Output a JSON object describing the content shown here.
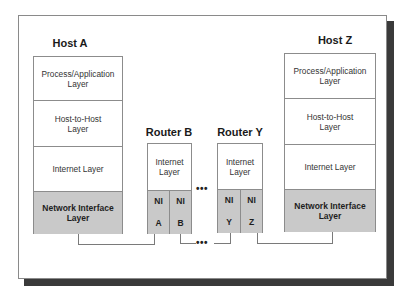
{
  "diagram": {
    "host_a": {
      "title": "Host A",
      "layers": [
        "Process/Application Layer",
        "Host-to-Host Layer",
        "Internet Layer",
        "Network Interface Layer"
      ]
    },
    "router_b": {
      "title": "Router B",
      "internet_layer": "Internet Layer",
      "ni_left": {
        "top": "NI",
        "bottom": "A"
      },
      "ni_right": {
        "top": "NI",
        "bottom": "B"
      }
    },
    "router_y": {
      "title": "Router Y",
      "internet_layer": "Internet Layer",
      "ni_left": {
        "top": "NI",
        "bottom": "Y"
      },
      "ni_right": {
        "top": "NI",
        "bottom": "Z"
      }
    },
    "host_z": {
      "title": "Host Z",
      "layers": [
        "Process/Application Layer",
        "Host-to-Host Layer",
        "Internet Layer",
        "Network Interface Layer"
      ]
    },
    "ellipsis_upper": "•••",
    "ellipsis_lower": "•••",
    "colors": {
      "network_interface_fill": "#c9c9c9",
      "border": "#8c8c8c",
      "shadow": "#3a3a3a"
    }
  }
}
